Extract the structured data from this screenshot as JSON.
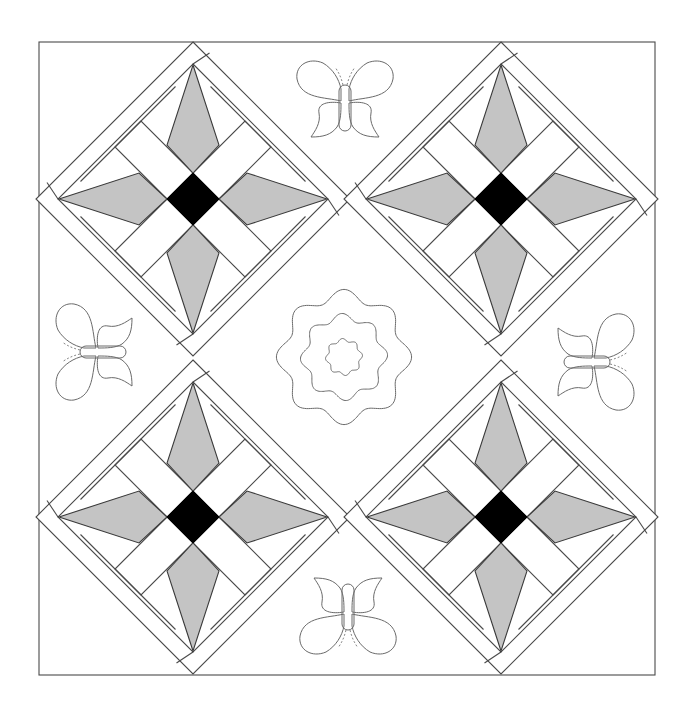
{
  "diagram": {
    "title": "",
    "frame": {
      "x": 39,
      "y": 42,
      "width": 616,
      "height": 633
    },
    "colors": {
      "line": "#4a4a4a",
      "kite_fill": "#c4c4c4",
      "center_fill": "#000000",
      "background": "#ffffff",
      "quilting_line": "#6a6a6a"
    },
    "blocks": [
      {
        "name": "star-block-top-left",
        "cx": 193,
        "cy": 199
      },
      {
        "name": "star-block-top-right",
        "cx": 501,
        "cy": 199
      },
      {
        "name": "star-block-bottom-left",
        "cx": 193,
        "cy": 517
      },
      {
        "name": "star-block-bottom-right",
        "cx": 501,
        "cy": 517
      }
    ],
    "block_geometry": {
      "outer_half_diagonal": 157,
      "inner_half_diagonal": 135,
      "center_half_diagonal": 26,
      "kite_side_offset": 54,
      "strip_cap": 52
    },
    "motifs": {
      "center_flower": {
        "cx": 344,
        "cy": 357,
        "rings": [
          62,
          40,
          17
        ],
        "lobes": 8
      },
      "butterflies": [
        {
          "name": "butterfly-top",
          "cx": 345,
          "cy": 103,
          "rotation": 0
        },
        {
          "name": "butterfly-left",
          "cx": 98,
          "cy": 352,
          "rotation": -90
        },
        {
          "name": "butterfly-right",
          "cx": 592,
          "cy": 362,
          "rotation": 90
        },
        {
          "name": "butterfly-bottom",
          "cx": 348,
          "cy": 612,
          "rotation": 180
        }
      ]
    }
  }
}
